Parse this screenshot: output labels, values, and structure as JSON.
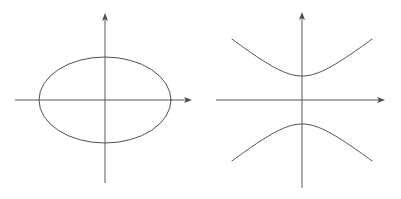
{
  "figure": {
    "background_color": "#ffffff",
    "curve_color": "#4f4f4f",
    "axis_color": "#595959",
    "width": 401,
    "height": 199,
    "panels": [
      {
        "id": "ellipse-panel",
        "name": "ellipse-diagram",
        "caption": "",
        "axes": {
          "x_axis": {
            "name": "x-axis",
            "y": 100,
            "x_start": 15,
            "x_end": 192,
            "arrow": "right"
          },
          "y_axis": {
            "name": "y-axis",
            "x": 105,
            "y_start": 183,
            "y_end": 13,
            "arrow": "up"
          }
        },
        "curve": {
          "type": "ellipse",
          "name": "ellipse-curve",
          "center_x": 105,
          "center_y": 100,
          "radius_x": 66,
          "radius_y": 43
        }
      },
      {
        "id": "hyperbola-panel",
        "name": "hyperbola-diagram",
        "caption": "",
        "axes": {
          "x_axis": {
            "name": "x-axis",
            "y": 100,
            "x_start": 216,
            "x_end": 385,
            "arrow": "right"
          },
          "y_axis": {
            "name": "y-axis",
            "x": 302,
            "y_start": 188,
            "y_end": 12,
            "arrow": "up"
          }
        },
        "curve": {
          "type": "hyperbola",
          "orientation": "vertical",
          "name": "hyperbola-curve",
          "center_x": 302,
          "center_y": 100,
          "semi_axis_a": 24,
          "semi_axis_b": 30,
          "vertex_upper_y": 76,
          "vertex_lower_y": 124,
          "branch_extent_x": 70,
          "upper_branch_name": "hyperbola-upper-branch",
          "lower_branch_name": "hyperbola-lower-branch"
        }
      }
    ]
  },
  "chart_data": {
    "type": "line",
    "subtitle": "",
    "xlabel": "x",
    "ylabel": "y",
    "grid": false,
    "legend": "none",
    "annotations": [],
    "panels": [
      {
        "name": "ellipse",
        "equation": "x^2/a^2 + y^2/b^2 = 1",
        "a": 66,
        "b": 43,
        "center": [
          0,
          0
        ],
        "xlim": [
          -90,
          87
        ],
        "ylim": [
          -83,
          87
        ],
        "vertices": [
          [
            -66,
            0
          ],
          [
            66,
            0
          ],
          [
            0,
            43
          ],
          [
            0,
            -43
          ]
        ]
      },
      {
        "name": "hyperbola",
        "equation": "y^2/a^2 - x^2/b^2 = 1",
        "a": 24,
        "b": 30,
        "center": [
          0,
          0
        ],
        "xlim": [
          -86,
          83
        ],
        "ylim": [
          -88,
          88
        ],
        "vertices": [
          [
            0,
            24
          ],
          [
            0,
            -24
          ]
        ],
        "asymptote_slopes": [
          0.8,
          -0.8
        ],
        "branches": [
          "upper",
          "lower"
        ]
      }
    ]
  }
}
